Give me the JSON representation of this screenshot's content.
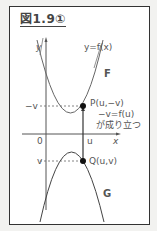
{
  "figure": {
    "title": "図1.9①",
    "y_axis_label": "y",
    "x_axis_label": "x",
    "origin_label": "0",
    "curve_f_equation": "y=f(x)",
    "curve_f_name": "F",
    "curve_g_name": "G",
    "tick_neg_v": "−v",
    "tick_v": "v",
    "tick_u": "u",
    "point_p": "P(u,−v)",
    "relation_line1": "−v=f(u)",
    "relation_line2": "が成り立つ",
    "point_q": "Q(u,v)"
  }
}
